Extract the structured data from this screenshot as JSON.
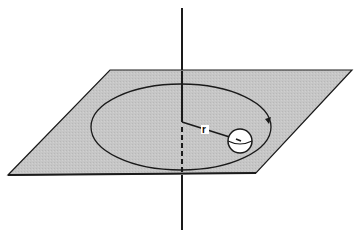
{
  "diagram": {
    "type": "physics-illustration",
    "labels": {
      "radius": "r"
    },
    "colors": {
      "plane_fill": "#c4c4c4",
      "stroke": "#1a1a1a",
      "background": "#ffffff",
      "ball_fill": "#ffffff",
      "label_bg": "#ffffff"
    },
    "elements": {
      "plane": {
        "corners": [
          [
            110,
            70
          ],
          [
            352,
            70
          ],
          [
            256,
            173
          ],
          [
            8,
            175
          ]
        ]
      },
      "axis": {
        "x": 182,
        "y_top": 8,
        "y_bottom": 230,
        "dashed_from": 128,
        "dashed_to": 173
      },
      "orbit": {
        "cx": 183,
        "cy": 126,
        "rx": 90,
        "ry": 43
      },
      "radius_line": {
        "from": [
          182,
          122
        ],
        "to": [
          238,
          140
        ]
      },
      "ball": {
        "cx": 240,
        "cy": 141,
        "r": 12
      },
      "direction_arrow": {
        "at": [
          269,
          121
        ]
      }
    }
  }
}
